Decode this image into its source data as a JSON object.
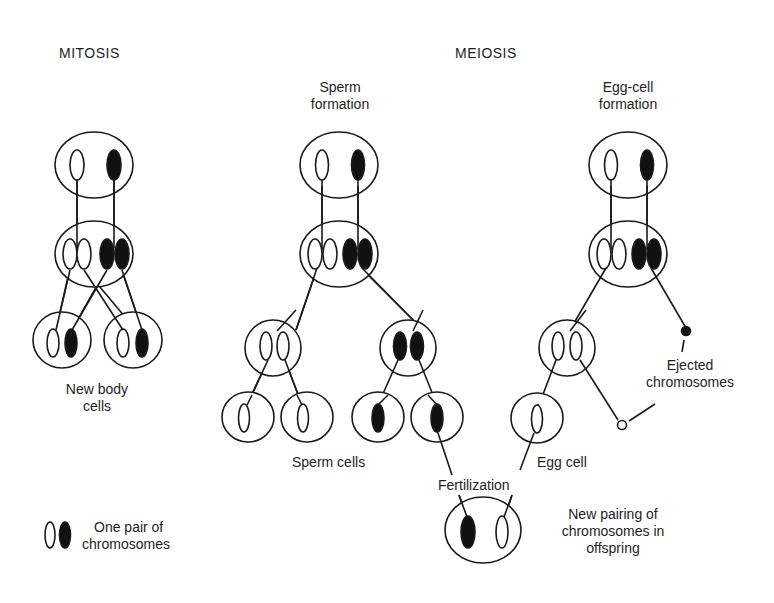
{
  "titles": {
    "mitosis": "MITOSIS",
    "meiosis": "MEIOSIS"
  },
  "columns": {
    "sperm": {
      "line1": "Sperm",
      "line2": "formation"
    },
    "egg": {
      "line1": "Egg-cell",
      "line2": "formation"
    }
  },
  "labels": {
    "new_body_cells": {
      "line1": "New body",
      "line2": "cells"
    },
    "sperm_cells": "Sperm cells",
    "egg_cell": "Egg cell",
    "fertilization": "Fertilization",
    "ejected": {
      "line1": "Ejected",
      "line2": "chromosomes"
    },
    "offspring": {
      "line1": "New pairing of",
      "line2": "chromosomes in",
      "line3": "offspring"
    }
  },
  "legend": {
    "line1": "One pair of",
    "line2": "chromosomes",
    "icon": "chromosome-pair-icon"
  },
  "colors": {
    "stroke": "#1a1a1a",
    "fill_dark": "#111111",
    "fill_light": "#ffffff",
    "background": "#ffffff"
  }
}
